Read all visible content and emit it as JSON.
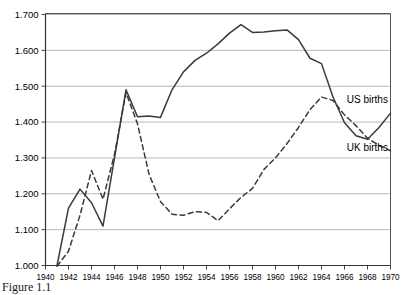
{
  "caption": {
    "text": "Figure 1.1"
  },
  "chart_data": {
    "type": "line",
    "title": "",
    "xlabel": "",
    "ylabel": "",
    "xlim": [
      1940,
      1970
    ],
    "ylim": [
      1.0,
      1.7
    ],
    "grid": true,
    "legend_position": "inline-right",
    "y_tick_labels": [
      "1.700",
      "1.600",
      "1.500",
      "1.400",
      "1.300",
      "1.200",
      "1.100",
      "1.000"
    ],
    "y_tick_values": [
      1.7,
      1.6,
      1.5,
      1.4,
      1.3,
      1.2,
      1.1,
      1.0
    ],
    "x_tick_labels": [
      "1940",
      "1942",
      "1944",
      "1946",
      "1948",
      "1950",
      "1952",
      "1954",
      "1956",
      "1958",
      "1960",
      "1962",
      "1964",
      "1966",
      "1968",
      "1970"
    ],
    "x_tick_values": [
      1940,
      1942,
      1944,
      1946,
      1948,
      1950,
      1952,
      1954,
      1956,
      1958,
      1960,
      1962,
      1964,
      1966,
      1968,
      1970
    ],
    "x": [
      1941,
      1942,
      1943,
      1944,
      1945,
      1946,
      1947,
      1948,
      1949,
      1950,
      1951,
      1952,
      1953,
      1954,
      1955,
      1956,
      1957,
      1958,
      1959,
      1960,
      1961,
      1962,
      1963,
      1964,
      1965,
      1966,
      1967,
      1968,
      1969,
      1970
    ],
    "series": [
      {
        "name": "US births",
        "label": "US births",
        "style": "solid",
        "color": "#3a3a3a",
        "label_x": 1966.2,
        "label_y": 1.452,
        "values": [
          1.0,
          1.16,
          1.213,
          1.175,
          1.11,
          1.3,
          1.49,
          1.415,
          1.417,
          1.413,
          1.49,
          1.54,
          1.572,
          1.592,
          1.618,
          1.648,
          1.672,
          1.65,
          1.651,
          1.655,
          1.657,
          1.63,
          1.578,
          1.563,
          1.47,
          1.398,
          1.362,
          1.352,
          1.385,
          1.425
        ]
      },
      {
        "name": "UK births",
        "label": "UK births",
        "style": "dashed",
        "color": "#3a3a3a",
        "label_x": 1966.2,
        "label_y": 1.318,
        "values": [
          0.998,
          1.04,
          1.14,
          1.265,
          1.185,
          1.31,
          1.482,
          1.395,
          1.255,
          1.178,
          1.143,
          1.14,
          1.15,
          1.148,
          1.125,
          1.158,
          1.19,
          1.215,
          1.268,
          1.3,
          1.34,
          1.385,
          1.435,
          1.47,
          1.46,
          1.42,
          1.39,
          1.355,
          1.335,
          1.32
        ]
      }
    ]
  }
}
